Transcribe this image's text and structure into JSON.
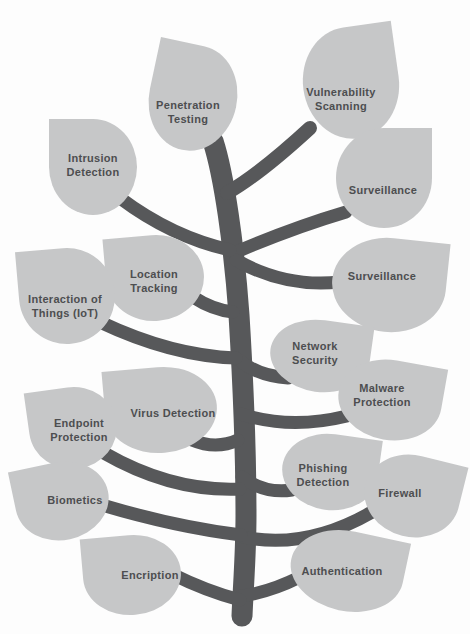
{
  "diagram": {
    "background_color": "#fdfdfd",
    "leaf_color": "#c6c7c8",
    "branch_color": "#57585a",
    "text_color": "#4d4e50",
    "leaves": [
      {
        "id": "penetration-testing",
        "label": "Penetration Testing",
        "side": "left"
      },
      {
        "id": "vulnerability-scanning",
        "label": "Vulnerability Scanning",
        "side": "right"
      },
      {
        "id": "intrusion-detection",
        "label": "Intrusion Detection",
        "side": "left"
      },
      {
        "id": "surveillance-upper",
        "label": "Surveillance",
        "side": "right"
      },
      {
        "id": "location-tracking",
        "label": "Location Tracking",
        "side": "left"
      },
      {
        "id": "surveillance-lower",
        "label": "Surveillance",
        "side": "right"
      },
      {
        "id": "interaction-of-things",
        "label": "Interaction of Things (IoT)",
        "side": "left"
      },
      {
        "id": "network-security",
        "label": "Network Security",
        "side": "right"
      },
      {
        "id": "virus-detection",
        "label": "Virus Detection",
        "side": "left"
      },
      {
        "id": "malware-protection",
        "label": "Malware Protection",
        "side": "right"
      },
      {
        "id": "endpoint-protection",
        "label": "Endpoint Protection",
        "side": "left"
      },
      {
        "id": "phishing-detection",
        "label": "Phishing Detection",
        "side": "right"
      },
      {
        "id": "biometics",
        "label": "Biometics",
        "side": "left"
      },
      {
        "id": "firewall",
        "label": "Firewall",
        "side": "right"
      },
      {
        "id": "encription",
        "label": "Encription",
        "side": "left"
      },
      {
        "id": "authentication",
        "label": "Authentication",
        "side": "right"
      }
    ]
  }
}
